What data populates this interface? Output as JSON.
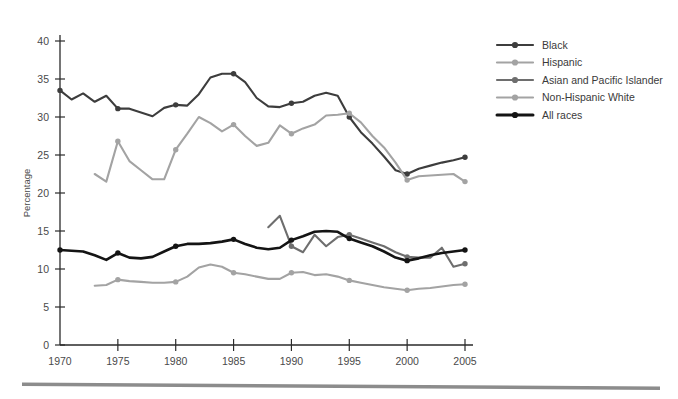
{
  "chart_data": {
    "type": "line",
    "title": "",
    "subtitle": "",
    "xlabel": "",
    "ylabel": "Percentage",
    "xlim": [
      1970,
      2005
    ],
    "ylim": [
      0,
      40
    ],
    "grid": false,
    "legend_position": "right",
    "x_ticks": [
      "1970",
      "1975",
      "1980",
      "1985",
      "1990",
      "1995",
      "2000",
      "2005"
    ],
    "x_tick_values": [
      1970,
      1975,
      1980,
      1985,
      1990,
      1995,
      2000,
      2005
    ],
    "y_ticks": [
      "0",
      "5",
      "10",
      "15",
      "20",
      "25",
      "30",
      "35",
      "40"
    ],
    "y_tick_values": [
      0,
      5,
      10,
      15,
      20,
      25,
      30,
      35,
      40
    ],
    "marker_interval_years": 5,
    "series": [
      {
        "name": "Black",
        "color": "#3d3d3d",
        "width": 2.1,
        "x": [
          1970,
          1971,
          1972,
          1973,
          1974,
          1975,
          1976,
          1977,
          1978,
          1979,
          1980,
          1981,
          1982,
          1983,
          1984,
          1985,
          1986,
          1987,
          1988,
          1989,
          1990,
          1991,
          1992,
          1993,
          1994,
          1995,
          1996,
          1997,
          1998,
          1999,
          2000,
          2001,
          2002,
          2003,
          2004,
          2005
        ],
        "values": [
          33.5,
          32.3,
          33.1,
          32.0,
          32.8,
          31.1,
          31.1,
          30.6,
          30.1,
          31.2,
          31.6,
          31.5,
          33.0,
          35.2,
          35.7,
          35.7,
          34.6,
          32.5,
          31.4,
          31.3,
          31.8,
          32.0,
          32.8,
          33.2,
          32.8,
          30.0,
          28.0,
          26.5,
          24.8,
          23.0,
          22.5,
          23.2,
          23.6,
          24.0,
          24.3,
          24.7
        ]
      },
      {
        "name": "Hispanic",
        "color": "#a3a3a3",
        "width": 2.1,
        "x": [
          1973,
          1974,
          1975,
          1976,
          1977,
          1978,
          1979,
          1980,
          1981,
          1982,
          1983,
          1984,
          1985,
          1986,
          1987,
          1988,
          1989,
          1990,
          1991,
          1992,
          1993,
          1994,
          1995,
          1996,
          1997,
          1998,
          1999,
          2000,
          2001,
          2002,
          2003,
          2004,
          2005
        ],
        "values": [
          22.5,
          21.5,
          26.8,
          24.2,
          23.0,
          21.8,
          21.8,
          25.7,
          27.8,
          30.0,
          29.2,
          28.1,
          29.0,
          27.5,
          26.2,
          26.6,
          28.9,
          27.8,
          28.5,
          29.0,
          30.2,
          30.3,
          30.5,
          29.3,
          27.5,
          26.0,
          24.0,
          21.7,
          22.2,
          22.3,
          22.4,
          22.5,
          21.5
        ]
      },
      {
        "name": "Asian and Pacific Islander",
        "color": "#6e6e6e",
        "width": 2.1,
        "x": [
          1988,
          1989,
          1990,
          1991,
          1992,
          1993,
          1994,
          1995,
          1996,
          1997,
          1998,
          1999,
          2000,
          2001,
          2002,
          2003,
          2004,
          2005
        ],
        "values": [
          15.5,
          17.0,
          13.0,
          12.2,
          14.5,
          13.0,
          14.2,
          14.5,
          14.0,
          13.5,
          13.0,
          12.2,
          11.6,
          11.5,
          11.5,
          12.8,
          10.3,
          10.7
        ]
      },
      {
        "name": "Non-Hispanic White",
        "color": "#a3a3a3",
        "width": 2.1,
        "x": [
          1973,
          1974,
          1975,
          1976,
          1977,
          1978,
          1979,
          1980,
          1981,
          1982,
          1983,
          1984,
          1985,
          1986,
          1987,
          1988,
          1989,
          1990,
          1991,
          1992,
          1993,
          1994,
          1995,
          1996,
          1997,
          1998,
          1999,
          2000,
          2001,
          2002,
          2003,
          2004,
          2005
        ],
        "values": [
          7.8,
          7.9,
          8.6,
          8.4,
          8.3,
          8.2,
          8.2,
          8.3,
          9.0,
          10.2,
          10.6,
          10.3,
          9.5,
          9.3,
          9.0,
          8.7,
          8.7,
          9.5,
          9.6,
          9.2,
          9.3,
          9.0,
          8.5,
          8.2,
          7.9,
          7.6,
          7.4,
          7.2,
          7.4,
          7.5,
          7.7,
          7.9,
          8.0
        ]
      },
      {
        "name": "All races",
        "color": "#141414",
        "width": 2.6,
        "x": [
          1970,
          1971,
          1972,
          1973,
          1974,
          1975,
          1976,
          1977,
          1978,
          1979,
          1980,
          1981,
          1982,
          1983,
          1984,
          1985,
          1986,
          1987,
          1988,
          1989,
          1990,
          1991,
          1992,
          1993,
          1994,
          1995,
          1996,
          1997,
          1998,
          1999,
          2000,
          2001,
          2002,
          2003,
          2004,
          2005
        ],
        "values": [
          12.5,
          12.4,
          12.3,
          11.8,
          11.2,
          12.1,
          11.5,
          11.4,
          11.6,
          12.3,
          13.0,
          13.3,
          13.3,
          13.4,
          13.6,
          13.9,
          13.3,
          12.8,
          12.6,
          12.8,
          13.8,
          14.3,
          14.9,
          15.0,
          14.9,
          14.0,
          13.5,
          13.0,
          12.3,
          11.5,
          11.1,
          11.4,
          11.8,
          12.1,
          12.3,
          12.5
        ]
      }
    ]
  },
  "legend": {
    "items": [
      {
        "label": "Black",
        "color": "#3d3d3d"
      },
      {
        "label": "Hispanic",
        "color": "#a3a3a3"
      },
      {
        "label": "Asian and Pacific Islander",
        "color": "#6e6e6e"
      },
      {
        "label": "Non-Hispanic White",
        "color": "#a3a3a3"
      },
      {
        "label": "All races",
        "color": "#141414"
      }
    ]
  },
  "footer": {
    "rule_color": "#8c8c8c"
  }
}
